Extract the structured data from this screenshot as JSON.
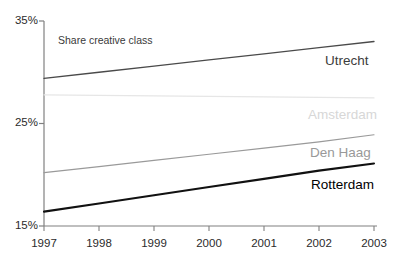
{
  "chart_data": {
    "type": "line",
    "title": "",
    "annotation": "Share creative class",
    "xlabel": "",
    "ylabel": "",
    "x": [
      1997,
      1998,
      1999,
      2000,
      2001,
      2002,
      2003
    ],
    "xtick_labels": [
      "1997",
      "1998",
      "1999",
      "2000",
      "2001",
      "2002",
      "2003"
    ],
    "xlim": [
      1997,
      2003
    ],
    "ylim": [
      15,
      35
    ],
    "ytick_values": [
      15,
      25,
      35
    ],
    "ytick_labels": [
      "15%",
      "25%",
      "35%"
    ],
    "grid": false,
    "legend_position": "right-inline-end-of-line",
    "series": [
      {
        "name": "Utrecht",
        "color": "#4a4a4a",
        "line_width": 1.3,
        "label_color": "#3c3c3c",
        "values": [
          29.4,
          30.0,
          30.6,
          31.2,
          31.8,
          32.4,
          33.0
        ]
      },
      {
        "name": "Amsterdam",
        "color": "#e6e6e6",
        "line_width": 1.2,
        "label_color": "#d7d7d7",
        "values": [
          27.8,
          27.75,
          27.7,
          27.65,
          27.6,
          27.55,
          27.5
        ]
      },
      {
        "name": "Den Haag",
        "color": "#9a9a9a",
        "line_width": 1.2,
        "label_color": "#999999",
        "values": [
          20.2,
          20.8,
          21.4,
          22.0,
          22.6,
          23.2,
          23.9
        ]
      },
      {
        "name": "Rotterdam",
        "color": "#111111",
        "line_width": 2.1,
        "label_color": "#000000",
        "values": [
          16.4,
          17.2,
          18.0,
          18.8,
          19.6,
          20.4,
          21.1
        ]
      }
    ]
  },
  "axis": {
    "line_color": "#808080",
    "tick_color": "#808080"
  }
}
